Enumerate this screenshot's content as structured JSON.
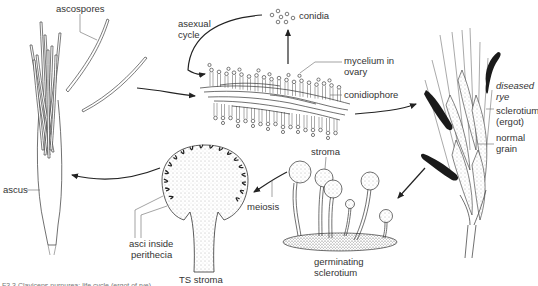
{
  "figure": {
    "caption": "F3.3 Claviceps purpurea: life cycle (ergot of rye)",
    "labels": {
      "ascospores": "ascospores",
      "asexual_cycle_line1": "asexual",
      "asexual_cycle_line2": "cycle",
      "conidia": "conidia",
      "mycelium_line1": "mycelium in",
      "mycelium_line2": "ovary",
      "conidiophore": "conidiophore",
      "diseased_line1": "diseased",
      "diseased_line2": "rye",
      "sclerotium_line1": "sclerotium",
      "sclerotium_line2": "(ergot)",
      "normal_line1": "normal",
      "normal_line2": "grain",
      "stroma": "stroma",
      "meiosis": "meiosis",
      "germinating_line1": "germinating",
      "germinating_line2": "sclerotium",
      "ts_stroma": "TS stroma",
      "asci_line1": "asci inside",
      "asci_line2": "perithecia",
      "ascus": "ascus"
    },
    "stages": [
      "ascospores",
      "mycelium in ovary with conidiophores",
      "diseased rye with sclerotium (ergot)",
      "germinating sclerotium with stroma",
      "TS stroma with asci inside perithecia",
      "ascus"
    ]
  }
}
